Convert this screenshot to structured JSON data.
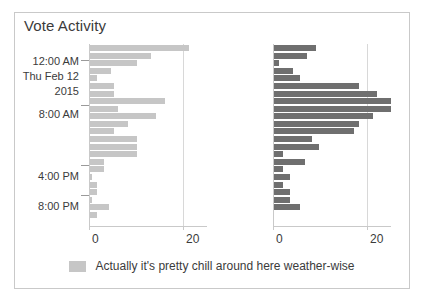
{
  "panel": {
    "title": "Vote Activity",
    "background": "#ffffff",
    "border_color": "#c9c9c9"
  },
  "legend": {
    "label": "Actually it's pretty chill around here weather-wise",
    "swatch_color": "#c6c6c6",
    "position": "bottom-center"
  },
  "chart_data": [
    {
      "type": "bar",
      "orientation": "horizontal",
      "id": "left-panel",
      "title": "Vote Activity",
      "series_name": "Actually it's pretty chill around here weather-wise",
      "color": "#c6c6c6",
      "xlabel": "",
      "ylabel": "",
      "xlim": [
        0,
        25
      ],
      "ylim": [
        0,
        24
      ],
      "xticks": [
        0,
        20
      ],
      "xticklabels": [
        "0",
        "20"
      ],
      "grid": true,
      "yticklabels": [
        "12:00 AM",
        "Thu Feb 12",
        "2015",
        "8:00 AM",
        "4:00 PM",
        "8:00 PM"
      ],
      "categories": [
        "11:00 PM",
        "12:00 AM",
        "1:00 AM",
        "2:00 AM",
        "3:00 AM",
        "4:00 AM",
        "5:00 AM",
        "6:00 AM",
        "7:00 AM",
        "8:00 AM",
        "9:00 AM",
        "10:00 AM",
        "11:00 AM",
        "12:00 PM",
        "1:00 PM",
        "2:00 PM",
        "3:00 PM",
        "4:00 PM",
        "5:00 PM",
        "6:00 PM",
        "7:00 PM",
        "8:00 PM",
        "9:00 PM",
        "10:00 PM"
      ],
      "values": [
        21,
        13,
        10,
        4.5,
        1.5,
        5,
        5,
        16,
        6,
        14,
        8,
        5,
        10,
        10,
        10,
        3,
        3,
        0.4,
        1.5,
        1.5,
        0.4,
        4,
        1.5,
        0
      ]
    },
    {
      "type": "bar",
      "orientation": "horizontal",
      "id": "right-panel",
      "series_name": "votes",
      "color": "#6f6f6f",
      "xlabel": "",
      "ylabel": "",
      "xlim": [
        0,
        25
      ],
      "ylim": [
        0,
        24
      ],
      "xticks": [
        0,
        20
      ],
      "xticklabels": [
        "0",
        "20"
      ],
      "grid": true,
      "categories": [
        "11:00 PM",
        "12:00 AM",
        "1:00 AM",
        "2:00 AM",
        "3:00 AM",
        "4:00 AM",
        "5:00 AM",
        "6:00 AM",
        "7:00 AM",
        "8:00 AM",
        "9:00 AM",
        "10:00 AM",
        "11:00 AM",
        "12:00 PM",
        "1:00 PM",
        "2:00 PM",
        "3:00 PM",
        "4:00 PM",
        "5:00 PM",
        "6:00 PM",
        "7:00 PM",
        "8:00 PM",
        "9:00 PM",
        "10:00 PM"
      ],
      "values": [
        9,
        7,
        1,
        4,
        5.5,
        18,
        22,
        26,
        26,
        21,
        18,
        17,
        8,
        9.5,
        2,
        6.5,
        2,
        3.5,
        2,
        3.5,
        3.5,
        5.5,
        0,
        0
      ]
    }
  ],
  "y_axis": [
    {
      "label": "12:00 AM",
      "tick": true
    },
    {
      "label": "Thu Feb 12",
      "tick": false
    },
    {
      "label": "2015",
      "tick": false
    },
    {
      "label": "8:00 AM",
      "tick": true
    },
    {
      "label": "4:00 PM",
      "tick": true
    },
    {
      "label": "8:00 PM",
      "tick": true
    }
  ]
}
